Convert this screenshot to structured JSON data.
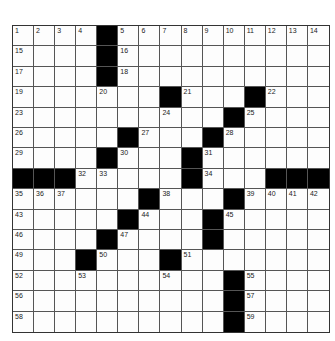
{
  "puzzle": {
    "rows": 15,
    "cols": 15,
    "colors": {
      "block": "#000000",
      "cell": "#fdfdfd",
      "line": "#555555"
    },
    "grid": [
      "....#..........",
      "....#..........",
      "....#..........",
      ".......#...#...",
      "..........#....",
      ".....#...#.....",
      "....#...#......",
      "###.....#...###",
      "......#...#....",
      ".....#...#.....",
      "....#....#.....",
      "...#...#.......",
      "..........#....",
      "..........#....",
      "..........#...."
    ],
    "numbers": [
      {
        "r": 0,
        "c": 0,
        "n": "1"
      },
      {
        "r": 0,
        "c": 1,
        "n": "2"
      },
      {
        "r": 0,
        "c": 2,
        "n": "3"
      },
      {
        "r": 0,
        "c": 3,
        "n": "4"
      },
      {
        "r": 0,
        "c": 5,
        "n": "5"
      },
      {
        "r": 0,
        "c": 6,
        "n": "6"
      },
      {
        "r": 0,
        "c": 7,
        "n": "7"
      },
      {
        "r": 0,
        "c": 8,
        "n": "8"
      },
      {
        "r": 0,
        "c": 9,
        "n": "9"
      },
      {
        "r": 0,
        "c": 10,
        "n": "10"
      },
      {
        "r": 0,
        "c": 11,
        "n": "11"
      },
      {
        "r": 0,
        "c": 12,
        "n": "12"
      },
      {
        "r": 0,
        "c": 13,
        "n": "13"
      },
      {
        "r": 0,
        "c": 14,
        "n": "14"
      },
      {
        "r": 1,
        "c": 0,
        "n": "15"
      },
      {
        "r": 1,
        "c": 5,
        "n": "16"
      },
      {
        "r": 2,
        "c": 0,
        "n": "17"
      },
      {
        "r": 2,
        "c": 5,
        "n": "18"
      },
      {
        "r": 3,
        "c": 0,
        "n": "19"
      },
      {
        "r": 3,
        "c": 4,
        "n": "20"
      },
      {
        "r": 3,
        "c": 8,
        "n": "21"
      },
      {
        "r": 3,
        "c": 12,
        "n": "22"
      },
      {
        "r": 4,
        "c": 0,
        "n": "23"
      },
      {
        "r": 4,
        "c": 7,
        "n": "24"
      },
      {
        "r": 4,
        "c": 11,
        "n": "25"
      },
      {
        "r": 5,
        "c": 0,
        "n": "26"
      },
      {
        "r": 5,
        "c": 6,
        "n": "27"
      },
      {
        "r": 5,
        "c": 10,
        "n": "28"
      },
      {
        "r": 6,
        "c": 0,
        "n": "29"
      },
      {
        "r": 6,
        "c": 5,
        "n": "30"
      },
      {
        "r": 6,
        "c": 9,
        "n": "31"
      },
      {
        "r": 7,
        "c": 3,
        "n": "32"
      },
      {
        "r": 7,
        "c": 4,
        "n": "33"
      },
      {
        "r": 7,
        "c": 9,
        "n": "34"
      },
      {
        "r": 8,
        "c": 0,
        "n": "35"
      },
      {
        "r": 8,
        "c": 1,
        "n": "36"
      },
      {
        "r": 8,
        "c": 2,
        "n": "37"
      },
      {
        "r": 8,
        "c": 7,
        "n": "38"
      },
      {
        "r": 8,
        "c": 11,
        "n": "39"
      },
      {
        "r": 8,
        "c": 12,
        "n": "40"
      },
      {
        "r": 8,
        "c": 13,
        "n": "41"
      },
      {
        "r": 8,
        "c": 14,
        "n": "42"
      },
      {
        "r": 9,
        "c": 0,
        "n": "43"
      },
      {
        "r": 9,
        "c": 6,
        "n": "44"
      },
      {
        "r": 9,
        "c": 10,
        "n": "45"
      },
      {
        "r": 10,
        "c": 0,
        "n": "46"
      },
      {
        "r": 10,
        "c": 5,
        "n": "47"
      },
      {
        "r": 10,
        "c": 9,
        "n": "48"
      },
      {
        "r": 11,
        "c": 0,
        "n": "49"
      },
      {
        "r": 11,
        "c": 4,
        "n": "50"
      },
      {
        "r": 11,
        "c": 8,
        "n": "51"
      },
      {
        "r": 12,
        "c": 0,
        "n": "52"
      },
      {
        "r": 12,
        "c": 3,
        "n": "53"
      },
      {
        "r": 12,
        "c": 7,
        "n": "54"
      },
      {
        "r": 12,
        "c": 11,
        "n": "55"
      },
      {
        "r": 13,
        "c": 0,
        "n": "56"
      },
      {
        "r": 13,
        "c": 11,
        "n": "57"
      },
      {
        "r": 14,
        "c": 0,
        "n": "58"
      },
      {
        "r": 14,
        "c": 11,
        "n": "59"
      }
    ]
  }
}
